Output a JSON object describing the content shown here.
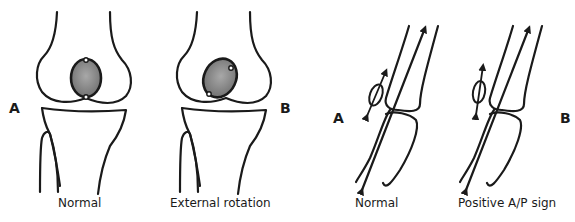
{
  "figure": {
    "panels": [
      {
        "id": "knee-front-A",
        "letter": "A",
        "caption": "Normal"
      },
      {
        "id": "knee-front-B",
        "letter": "B",
        "caption": "External rotation"
      },
      {
        "id": "knee-side-A",
        "letter": "A",
        "caption": "Normal"
      },
      {
        "id": "knee-side-B",
        "letter": "B",
        "caption": "Positive A/P sign"
      }
    ],
    "colors": {
      "line": "#1a1a1a",
      "patella_fill": "#8a8a8a",
      "background": "#ffffff"
    }
  }
}
